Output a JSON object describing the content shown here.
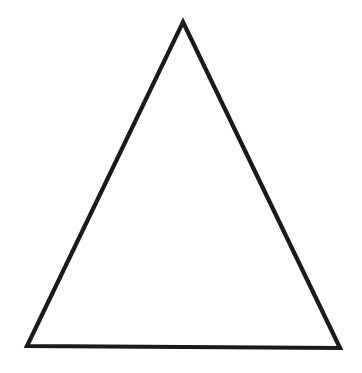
{
  "canvas": {
    "width": 362,
    "height": 373,
    "background_color": "#ffffff",
    "description": "Line drawing of a single unfilled triangle"
  },
  "figure": {
    "name": "triangle",
    "shape_type": "triangle",
    "classification": "isosceles",
    "fill": "none",
    "fill_color": "#ffffff",
    "stroke_color": "#1a1a1a",
    "stroke_width_px": 4,
    "orientation": "apex-up",
    "vertices": [
      {
        "label": "apex",
        "x": 183,
        "y": 22
      },
      {
        "label": "bottom-right",
        "x": 340,
        "y": 348
      },
      {
        "label": "bottom-left",
        "x": 27,
        "y": 346
      }
    ],
    "points_attr": "183,22 340,348 27,346",
    "edges": [
      {
        "label": "left-edge",
        "from": "apex",
        "to": "bottom-left"
      },
      {
        "label": "right-edge",
        "from": "apex",
        "to": "bottom-right"
      },
      {
        "label": "base-edge",
        "from": "bottom-left",
        "to": "bottom-right"
      }
    ],
    "base_width_px": 313,
    "height_px": 325
  },
  "accessibility": {
    "alt_text": "A black outlined triangle pointing upward on a white background"
  }
}
